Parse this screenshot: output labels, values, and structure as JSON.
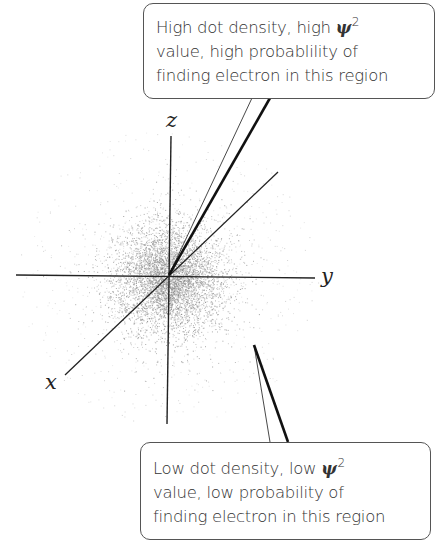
{
  "diagram": {
    "type": "electron probability density (1s orbital dot-density plot)",
    "axes": [
      {
        "name": "x",
        "label": "x"
      },
      {
        "name": "y",
        "label": "y"
      },
      {
        "name": "z",
        "label": "z"
      }
    ],
    "colors": {
      "background": "#ffffff",
      "axis": "#222222",
      "dots": "#8a8a8a",
      "callout_border": "#555555",
      "text": "#333333"
    }
  },
  "callouts": {
    "high": {
      "lines": [
        "High dot density, high ",
        "value, high probablility of",
        "finding electron in this region"
      ],
      "symbol": "ψ",
      "exponent": "2"
    },
    "low": {
      "lines": [
        "Low dot density, low ",
        "value, low probability of",
        "finding electron in this region"
      ],
      "symbol": "ψ",
      "exponent": "2"
    }
  }
}
